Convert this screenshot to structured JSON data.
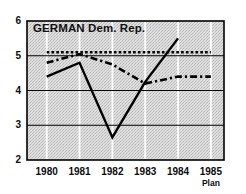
{
  "chart_data": {
    "type": "line",
    "title": "GERMAN Dem. Rep.",
    "xlabel": "",
    "ylabel": "",
    "xlim": [
      1979.4,
      1985.4
    ],
    "ylim": [
      2,
      6
    ],
    "yticks": [
      2,
      3,
      4,
      5,
      6
    ],
    "ytick_labels": [
      "2",
      "3",
      "4",
      "5",
      "6"
    ],
    "xticks": [
      1980,
      1981,
      1982,
      1983,
      1984,
      1985
    ],
    "xtick_labels": [
      "1980",
      "1981",
      "1982",
      "1983",
      "1984",
      "1985"
    ],
    "xtick_sublabels": [
      "",
      "",
      "",
      "",
      "",
      "Plan"
    ],
    "grid": {
      "horizontal": true,
      "horizontal_values": [
        3,
        4,
        5
      ],
      "horizontal_color": "#000000",
      "vertical": true,
      "vertical_values": [
        1980,
        1981,
        1982,
        1983,
        1984,
        1985
      ],
      "vertical_color": "#ffffff"
    },
    "plot_background": "#d9d9d9",
    "frame_color": "#000000",
    "legend": "none",
    "series": [
      {
        "name": "plan-reference",
        "style": "dotted",
        "color": "#000000",
        "x": [
          1980.0,
          1985.0
        ],
        "values": [
          5.1,
          5.1
        ]
      },
      {
        "name": "average-trend",
        "style": "dash-dot",
        "color": "#000000",
        "x": [
          1980.0,
          1981.0,
          1982.0,
          1983.0,
          1984.0,
          1985.0
        ],
        "values": [
          4.8,
          5.05,
          4.75,
          4.2,
          4.4,
          4.4
        ]
      },
      {
        "name": "actual-annual",
        "style": "solid",
        "color": "#000000",
        "x": [
          1980.0,
          1981.0,
          1982.0,
          1983.0,
          1984.0
        ],
        "values": [
          4.4,
          4.8,
          2.65,
          4.25,
          5.5
        ]
      }
    ]
  }
}
